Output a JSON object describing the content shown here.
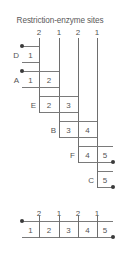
{
  "title": "Restriction-enzyme sites",
  "top_axis": {
    "cut_labels": [
      "2",
      "1",
      "2",
      "1"
    ],
    "cut_x": [
      39,
      59,
      78,
      97
    ]
  },
  "rows": [
    {
      "label": "D",
      "segments": [
        "1"
      ],
      "left": 22,
      "right": 39,
      "dot_left": true,
      "dot_right": false
    },
    {
      "label": "A",
      "segments": [
        "1",
        "2"
      ],
      "left": 22,
      "right": 59,
      "dot_left": true,
      "dot_right": false
    },
    {
      "label": "E",
      "segments": [
        "2",
        "3"
      ],
      "left": 39,
      "right": 78,
      "dot_left": false,
      "dot_right": false
    },
    {
      "label": "B",
      "segments": [
        "3",
        "4"
      ],
      "left": 59,
      "right": 97,
      "dot_left": false,
      "dot_right": false
    },
    {
      "label": "F",
      "segments": [
        "4",
        "5"
      ],
      "left": 78,
      "right": 113,
      "dot_left": false,
      "dot_right": true
    },
    {
      "label": "C",
      "segments": [
        "5"
      ],
      "left": 97,
      "right": 113,
      "dot_left": false,
      "dot_right": true
    }
  ],
  "bottom_map": {
    "cut_labels": [
      "2",
      "1",
      "2",
      "1"
    ],
    "segment_labels": [
      "1",
      "2",
      "3",
      "4",
      "5"
    ],
    "left": 22,
    "right": 113,
    "dot_left": true,
    "dot_right": true
  },
  "colors": {
    "line": "#7a7a7a",
    "cut_line": "#6e6e6e",
    "dot": "#3a3a3a",
    "text": "#555555",
    "background": "#ffffff"
  }
}
